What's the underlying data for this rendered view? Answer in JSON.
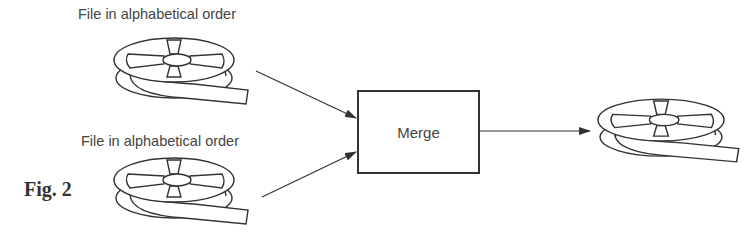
{
  "diagram": {
    "type": "flow",
    "figure_label": "Fig. 2",
    "nodes": [
      {
        "id": "input1",
        "kind": "tape-reel",
        "label": "File in alphabetical order"
      },
      {
        "id": "input2",
        "kind": "tape-reel",
        "label": "File in alphabetical order"
      },
      {
        "id": "merge",
        "kind": "process-box",
        "label": "Merge"
      },
      {
        "id": "output",
        "kind": "tape-reel",
        "label": ""
      }
    ],
    "edges": [
      {
        "from": "input1",
        "to": "merge"
      },
      {
        "from": "input2",
        "to": "merge"
      },
      {
        "from": "merge",
        "to": "output"
      }
    ],
    "colors": {
      "line": "#333333",
      "background": "#ffffff"
    }
  }
}
